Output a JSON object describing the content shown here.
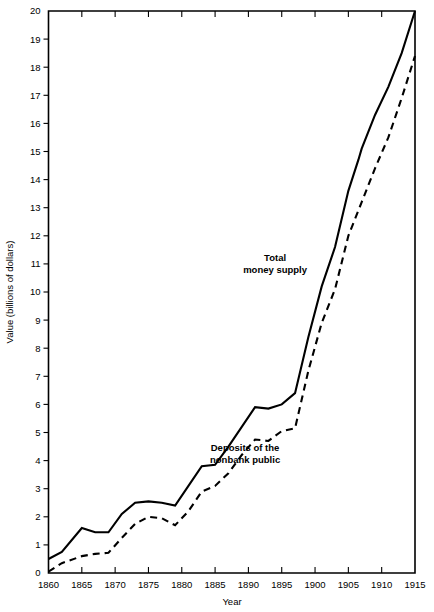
{
  "chart_data": {
    "type": "line",
    "title": "",
    "xlabel": "Year",
    "ylabel": "Value (billions of dollars)",
    "xlim": [
      1860,
      1915
    ],
    "ylim": [
      0,
      20
    ],
    "grid": false,
    "legend_position": "inline-annotation",
    "x_ticks": [
      1860,
      1865,
      1870,
      1875,
      1880,
      1885,
      1890,
      1895,
      1900,
      1905,
      1910,
      1915
    ],
    "y_ticks": [
      0,
      1,
      2,
      3,
      4,
      5,
      6,
      7,
      8,
      9,
      10,
      11,
      12,
      13,
      14,
      15,
      16,
      17,
      18,
      19,
      20
    ],
    "x_tick_labels": [
      "1860",
      "1865",
      "1870",
      "1875",
      "1880",
      "1885",
      "1890",
      "1895",
      "1900",
      "1905",
      "1910",
      "1915"
    ],
    "y_tick_labels": [
      "0",
      "1",
      "2",
      "3",
      "4",
      "5",
      "6",
      "7",
      "8",
      "9",
      "10",
      "11",
      "12",
      "13",
      "14",
      "15",
      "16",
      "17",
      "18",
      "19",
      "20"
    ],
    "series": [
      {
        "name": "Total money supply",
        "style": "solid",
        "color": "#000000",
        "label_text": "Total\nmoney supply",
        "label_lines": [
          "Total",
          "money supply"
        ],
        "label_x": 1894,
        "label_y": 11.1,
        "x": [
          1860,
          1862,
          1865,
          1867,
          1869,
          1871,
          1873,
          1875,
          1877,
          1879,
          1881,
          1883,
          1885,
          1887,
          1889,
          1891,
          1893,
          1895,
          1897,
          1899,
          1901,
          1903,
          1905,
          1906.5,
          1907,
          1909,
          1911,
          1913,
          1915
        ],
        "values": [
          0.5,
          0.75,
          1.6,
          1.45,
          1.45,
          2.1,
          2.5,
          2.55,
          2.5,
          2.4,
          3.1,
          3.8,
          3.85,
          4.5,
          5.2,
          5.9,
          5.85,
          6.0,
          6.4,
          8.4,
          10.2,
          11.6,
          13.6,
          14.7,
          15.1,
          16.3,
          17.3,
          18.5,
          20.0
        ]
      },
      {
        "name": "Deposits of the nonbank public",
        "style": "dashed",
        "color": "#000000",
        "label_text": "Deposits of the\nnonbank public",
        "label_lines": [
          "Deposits of the",
          "nonbank public"
        ],
        "label_x": 1889.5,
        "label_y": 4.35,
        "x": [
          1860,
          1862,
          1865,
          1867,
          1869,
          1871,
          1873,
          1875,
          1877,
          1879,
          1881,
          1883,
          1885,
          1887,
          1889,
          1891,
          1893,
          1895,
          1897,
          1899,
          1901,
          1903,
          1905,
          1906.5,
          1907,
          1909,
          1911,
          1913,
          1915
        ],
        "values": [
          0.05,
          0.35,
          0.6,
          0.68,
          0.72,
          1.25,
          1.75,
          2.0,
          1.95,
          1.7,
          2.2,
          2.9,
          3.1,
          3.55,
          4.2,
          4.75,
          4.7,
          5.05,
          5.15,
          7.2,
          8.9,
          10.1,
          12.0,
          12.9,
          13.2,
          14.4,
          15.5,
          16.9,
          18.4
        ]
      }
    ]
  },
  "axis": {
    "y_label": "Value (billions of dollars)",
    "x_label": "Year"
  },
  "annotations": {
    "total_money_supply_line1": "Total",
    "total_money_supply_line2": "money supply",
    "deposits_line1": "Deposits of the",
    "deposits_line2": "nonbank public"
  }
}
